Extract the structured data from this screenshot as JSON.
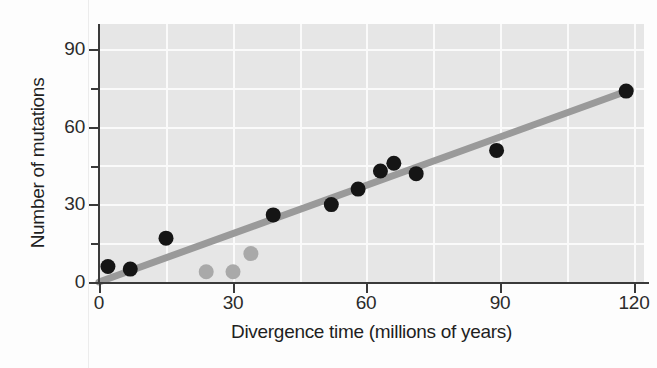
{
  "chart_data": {
    "type": "scatter",
    "title": "",
    "xlabel": "Divergence time (millions of years)",
    "ylabel": "Number of mutations",
    "xlim": [
      0,
      122
    ],
    "ylim": [
      0,
      100
    ],
    "xticks": [
      0,
      30,
      60,
      90,
      120
    ],
    "yticks": [
      0,
      30,
      60,
      90
    ],
    "x_minor_tick_interval": 15,
    "y_minor_tick_interval": 15,
    "grid": true,
    "grid_color": "#fafafa",
    "plot_background": "#e6e6e6",
    "legend": "none",
    "series": [
      {
        "name": "primary-data-points",
        "marker": "circle",
        "color": "#151515",
        "points": [
          {
            "x": 2,
            "y": 6
          },
          {
            "x": 7,
            "y": 5
          },
          {
            "x": 15,
            "y": 17
          },
          {
            "x": 39,
            "y": 26
          },
          {
            "x": 52,
            "y": 30
          },
          {
            "x": 58,
            "y": 36
          },
          {
            "x": 63,
            "y": 43
          },
          {
            "x": 66,
            "y": 46
          },
          {
            "x": 71,
            "y": 42
          },
          {
            "x": 89,
            "y": 51
          },
          {
            "x": 118,
            "y": 74
          }
        ]
      },
      {
        "name": "outlier-data-points",
        "marker": "circle",
        "color": "#a9a9a9",
        "points": [
          {
            "x": 24,
            "y": 4
          },
          {
            "x": 30,
            "y": 4
          },
          {
            "x": 34,
            "y": 11
          }
        ]
      }
    ],
    "trendline": {
      "name": "regression-line",
      "color": "#9a9a9a",
      "x_start": 0,
      "y_start": 0,
      "x_end": 119,
      "y_end": 74.5,
      "slope": 0.626,
      "intercept": 0
    }
  },
  "axis": {
    "y_tick_labels": [
      "90",
      "60",
      "30",
      "0"
    ],
    "x_tick_labels": [
      "0",
      "30",
      "60",
      "90",
      "120"
    ],
    "x_title": "Divergence time (millions of years)",
    "y_title": "Number of mutations"
  }
}
